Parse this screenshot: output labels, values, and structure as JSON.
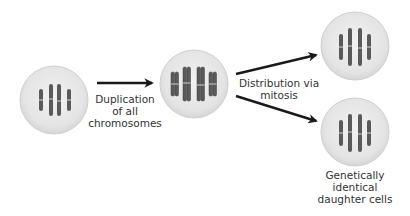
{
  "diagram": {
    "colors": {
      "cell_fill": "#e6e6e6",
      "cell_edge": "#d0d0d0",
      "chromosome": "#5a5a5a",
      "chromatid_outline": "#444444",
      "arrow": "#1a1a1a",
      "text": "#333333"
    },
    "cells": [
      {
        "id": "parent-cell",
        "cx": 54,
        "cy": 100,
        "r": 34,
        "state": "unduplicated",
        "chromosome_count": 4
      },
      {
        "id": "duplicated-cell",
        "cx": 194,
        "cy": 84,
        "r": 34,
        "state": "duplicated",
        "chromosome_count": 4
      },
      {
        "id": "daughter-cell-1",
        "cx": 355,
        "cy": 46,
        "r": 34,
        "state": "unduplicated",
        "chromosome_count": 4
      },
      {
        "id": "daughter-cell-2",
        "cx": 355,
        "cy": 132,
        "r": 34,
        "state": "unduplicated",
        "chromosome_count": 4
      }
    ],
    "arrows": [
      {
        "id": "duplication-arrow",
        "x1": 97,
        "y1": 83,
        "x2": 152,
        "y2": 83
      },
      {
        "id": "distribution-arrow-up",
        "x1": 236,
        "y1": 74,
        "x2": 316,
        "y2": 55
      },
      {
        "id": "distribution-arrow-down",
        "x1": 236,
        "y1": 96,
        "x2": 316,
        "y2": 121
      }
    ],
    "labels": {
      "duplication": [
        "Duplication",
        "of all",
        "chromosomes"
      ],
      "distribution": [
        "Distribution via",
        "mitosis"
      ],
      "daughters": [
        "Genetically",
        "identical",
        "daughter cells"
      ]
    }
  }
}
